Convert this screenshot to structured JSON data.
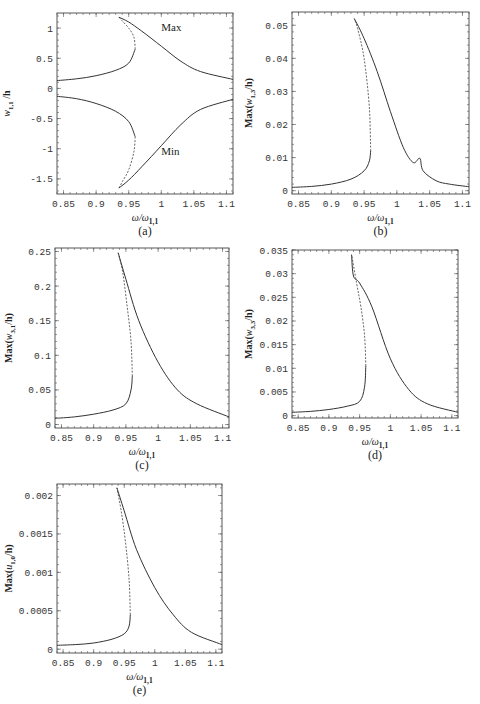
{
  "figure": {
    "xlabel": "ω/ω",
    "xlabel_sub": "1,1",
    "xticks": [
      "0.85",
      "0.9",
      "0.95",
      "1",
      "1.05",
      "1.1"
    ]
  },
  "chart_data": [
    {
      "type": "line",
      "panel": "a",
      "caption": "(a)",
      "xlabel": "ω/ω1,1",
      "ylabel": "w1,1/h",
      "xlim": [
        0.84,
        1.11
      ],
      "ylim": [
        -1.75,
        1.25
      ],
      "xticks": [
        0.85,
        0.9,
        0.95,
        1,
        1.05,
        1.1
      ],
      "yticks": [
        -1.5,
        -1,
        -0.5,
        0,
        0.5,
        1
      ],
      "ytick_labels": [
        "-1.5",
        "-1",
        "-0.5",
        "0",
        "0.5",
        "1"
      ],
      "annotations": [
        {
          "text": "Max",
          "x": 1.0,
          "y": 0.95
        },
        {
          "text": "Min",
          "x": 1.0,
          "y": -1.1
        }
      ],
      "series": [
        {
          "name": "Max stable (lower branch)",
          "style": "solid",
          "x": [
            0.84,
            0.87,
            0.9,
            0.93,
            0.95,
            0.96
          ],
          "y": [
            0.13,
            0.16,
            0.21,
            0.3,
            0.42,
            0.65
          ]
        },
        {
          "name": "Max unstable",
          "style": "dashed",
          "x": [
            0.96,
            0.958,
            0.95,
            0.94,
            0.935
          ],
          "y": [
            0.65,
            0.85,
            1.0,
            1.12,
            1.18
          ]
        },
        {
          "name": "Max stable (upper branch)",
          "style": "solid",
          "x": [
            0.935,
            0.95,
            0.97,
            1.0,
            1.03,
            1.06,
            1.11
          ],
          "y": [
            1.18,
            1.1,
            0.95,
            0.7,
            0.45,
            0.28,
            0.15
          ]
        },
        {
          "name": "Min stable (lower branch)",
          "style": "solid",
          "x": [
            0.84,
            0.87,
            0.9,
            0.93,
            0.95,
            0.96
          ],
          "y": [
            -0.13,
            -0.17,
            -0.25,
            -0.38,
            -0.55,
            -0.8
          ]
        },
        {
          "name": "Min unstable",
          "style": "dashed",
          "x": [
            0.96,
            0.958,
            0.95,
            0.94,
            0.935
          ],
          "y": [
            -0.8,
            -1.05,
            -1.35,
            -1.55,
            -1.65
          ]
        },
        {
          "name": "Min stable (upper branch)",
          "style": "solid",
          "x": [
            0.935,
            0.95,
            0.97,
            1.0,
            1.03,
            1.06,
            1.11
          ],
          "y": [
            -1.65,
            -1.52,
            -1.3,
            -0.95,
            -0.6,
            -0.35,
            -0.18
          ]
        }
      ]
    },
    {
      "type": "line",
      "panel": "b",
      "caption": "(b)",
      "xlabel": "ω/ω1,1",
      "ylabel": "Max(w1,3/h)",
      "xlim": [
        0.84,
        1.11
      ],
      "ylim": [
        -0.001,
        0.054
      ],
      "xticks": [
        0.85,
        0.9,
        0.95,
        1,
        1.05,
        1.1
      ],
      "yticks": [
        0,
        0.01,
        0.02,
        0.03,
        0.04,
        0.05
      ],
      "ytick_labels": [
        "0",
        "0.01",
        "0.02",
        "0.03",
        "0.04",
        "0.05"
      ],
      "series": [
        {
          "name": "stable lower",
          "style": "solid",
          "x": [
            0.84,
            0.87,
            0.9,
            0.93,
            0.95,
            0.958,
            0.96
          ],
          "y": [
            0.001,
            0.0013,
            0.002,
            0.0035,
            0.006,
            0.009,
            0.012
          ]
        },
        {
          "name": "unstable",
          "style": "dashed",
          "x": [
            0.96,
            0.958,
            0.95,
            0.94,
            0.935
          ],
          "y": [
            0.012,
            0.025,
            0.04,
            0.049,
            0.052
          ]
        },
        {
          "name": "stable upper",
          "style": "solid",
          "x": [
            0.935,
            0.95,
            0.97,
            0.99,
            1.01,
            1.025,
            1.035,
            1.04,
            1.06,
            1.08,
            1.11
          ],
          "y": [
            0.052,
            0.046,
            0.036,
            0.024,
            0.013,
            0.0085,
            0.0098,
            0.006,
            0.003,
            0.002,
            0.0012
          ]
        }
      ]
    },
    {
      "type": "line",
      "panel": "c",
      "caption": "(c)",
      "xlabel": "ω/ω1,1",
      "ylabel": "Max(w3,1/h)",
      "xlim": [
        0.84,
        1.11
      ],
      "ylim": [
        -0.005,
        0.255
      ],
      "xticks": [
        0.85,
        0.9,
        0.95,
        1,
        1.05,
        1.1
      ],
      "yticks": [
        0,
        0.05,
        0.1,
        0.15,
        0.2,
        0.25
      ],
      "ytick_labels": [
        "0",
        "0.05",
        "0.1",
        "0.15",
        "0.2",
        "0.25"
      ],
      "series": [
        {
          "name": "stable lower",
          "style": "solid",
          "x": [
            0.84,
            0.87,
            0.9,
            0.93,
            0.95,
            0.958,
            0.96
          ],
          "y": [
            0.009,
            0.011,
            0.015,
            0.021,
            0.03,
            0.05,
            0.07
          ]
        },
        {
          "name": "unstable",
          "style": "dashed",
          "x": [
            0.96,
            0.958,
            0.952,
            0.945,
            0.938
          ],
          "y": [
            0.07,
            0.12,
            0.17,
            0.22,
            0.248
          ]
        },
        {
          "name": "stable upper",
          "style": "solid",
          "x": [
            0.938,
            0.95,
            0.97,
            1.0,
            1.03,
            1.06,
            1.11
          ],
          "y": [
            0.248,
            0.21,
            0.15,
            0.09,
            0.05,
            0.03,
            0.011
          ]
        }
      ]
    },
    {
      "type": "line",
      "panel": "d",
      "caption": "(d)",
      "xlabel": "ω/ω1,1",
      "ylabel": "Max(w3,3/h)",
      "xlim": [
        0.84,
        1.11
      ],
      "ylim": [
        -0.0005,
        0.035
      ],
      "xticks": [
        0.85,
        0.9,
        0.95,
        1,
        1.05,
        1.1
      ],
      "yticks": [
        0,
        0.005,
        0.01,
        0.015,
        0.02,
        0.025,
        0.03,
        0.035
      ],
      "ytick_labels": [
        "0",
        "0.005",
        "0.01",
        "0.015",
        "0.02",
        "0.025",
        "0.03",
        "0.035"
      ],
      "series": [
        {
          "name": "stable lower",
          "style": "solid",
          "x": [
            0.84,
            0.87,
            0.9,
            0.93,
            0.95,
            0.958,
            0.96
          ],
          "y": [
            0.0007,
            0.0009,
            0.0013,
            0.002,
            0.003,
            0.006,
            0.0105
          ]
        },
        {
          "name": "unstable",
          "style": "dashed",
          "x": [
            0.96,
            0.958,
            0.952,
            0.945,
            0.937
          ],
          "y": [
            0.0105,
            0.017,
            0.023,
            0.028,
            0.034
          ]
        },
        {
          "name": "stable upper",
          "style": "solid",
          "x": [
            0.937,
            0.94,
            0.95,
            0.97,
            1.0,
            1.03,
            1.06,
            1.11
          ],
          "y": [
            0.034,
            0.0295,
            0.028,
            0.023,
            0.012,
            0.0055,
            0.0025,
            0.0007
          ]
        }
      ]
    },
    {
      "type": "line",
      "panel": "e",
      "caption": "(e)",
      "xlabel": "ω/ω1,1",
      "ylabel": "Max(u1,0/h)",
      "xlim": [
        0.84,
        1.11
      ],
      "ylim": [
        -5e-05,
        0.00215
      ],
      "xticks": [
        0.85,
        0.9,
        0.95,
        1,
        1.05,
        1.1
      ],
      "yticks": [
        0,
        0.0005,
        0.001,
        0.0015,
        0.002
      ],
      "ytick_labels": [
        "0",
        "0.0005",
        "0.001",
        "0.0015",
        "0.002"
      ],
      "series": [
        {
          "name": "stable lower",
          "style": "solid",
          "x": [
            0.84,
            0.87,
            0.9,
            0.93,
            0.95,
            0.958,
            0.96
          ],
          "y": [
            5e-05,
            6e-05,
            8e-05,
            0.00013,
            0.0002,
            0.0003,
            0.00045
          ]
        },
        {
          "name": "unstable",
          "style": "dashed",
          "x": [
            0.96,
            0.958,
            0.952,
            0.945,
            0.938
          ],
          "y": [
            0.00045,
            0.0009,
            0.0014,
            0.0018,
            0.0021
          ]
        },
        {
          "name": "stable upper",
          "style": "solid",
          "x": [
            0.938,
            0.95,
            0.97,
            1.0,
            1.03,
            1.06,
            1.11
          ],
          "y": [
            0.0021,
            0.0018,
            0.0013,
            0.0008,
            0.00045,
            0.00022,
            6e-05
          ]
        }
      ]
    }
  ]
}
